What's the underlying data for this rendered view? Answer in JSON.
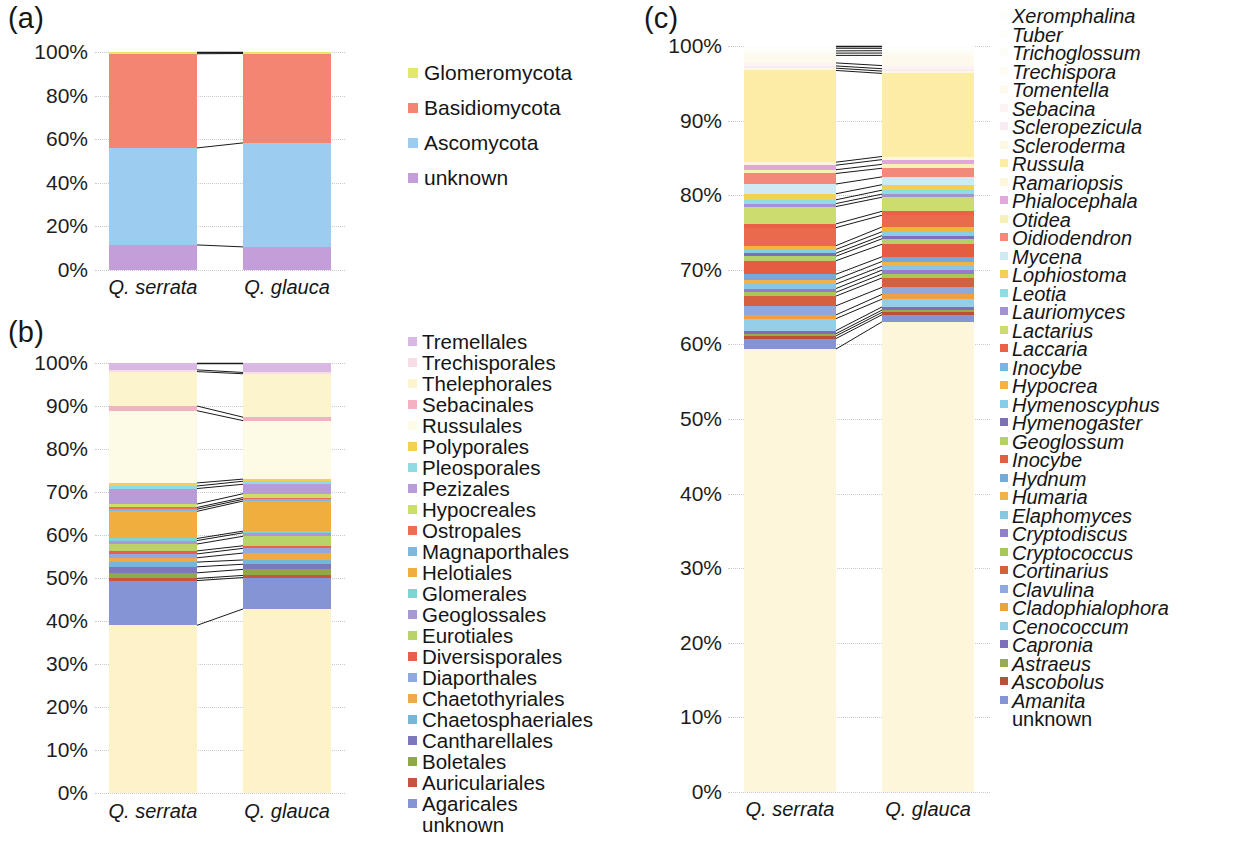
{
  "figure": {
    "panels": [
      "(a)",
      "(b)",
      "(c)"
    ],
    "x_categories": [
      "Q. serrata",
      "Q. glauca"
    ],
    "y_ticks_a": [
      "0%",
      "20%",
      "40%",
      "60%",
      "80%",
      "100%"
    ],
    "y_ticks_bc": [
      "0%",
      "10%",
      "20%",
      "30%",
      "40%",
      "50%",
      "60%",
      "70%",
      "80%",
      "90%",
      "100%"
    ],
    "unknown_label": "unknown"
  },
  "chart_data": [
    {
      "type": "bar",
      "id": "panel-a",
      "title": "(a)",
      "stacked": true,
      "normalized": true,
      "categories": [
        "Q. serrata",
        "Q. glauca"
      ],
      "xlabel": "",
      "ylabel": "",
      "ylim": [
        0,
        100
      ],
      "yticks": [
        0,
        20,
        40,
        60,
        80,
        100
      ],
      "grid": true,
      "legend_position": "right",
      "legend_order_top_to_bottom": [
        "Glomeromycota",
        "Basidiomycota",
        "Ascomycota",
        "unknown"
      ],
      "series": [
        {
          "name": "unknown",
          "color": "#c49ed8",
          "values": [
            11.5,
            10.6
          ]
        },
        {
          "name": "Ascomycota",
          "color": "#9ccdf0",
          "values": [
            44.5,
            47.7
          ]
        },
        {
          "name": "Basidiomycota",
          "color": "#f48572",
          "values": [
            43.2,
            41.0
          ]
        },
        {
          "name": "Glomeromycota",
          "color": "#e2e86a",
          "values": [
            0.8,
            0.7
          ]
        }
      ]
    },
    {
      "type": "bar",
      "id": "panel-b",
      "title": "(b)",
      "stacked": true,
      "normalized": true,
      "categories": [
        "Q. serrata",
        "Q. glauca"
      ],
      "xlabel": "",
      "ylabel": "",
      "ylim": [
        0,
        100
      ],
      "yticks": [
        0,
        10,
        20,
        30,
        40,
        50,
        60,
        70,
        80,
        90,
        100
      ],
      "grid": true,
      "legend_position": "right",
      "legend_order_top_to_bottom": [
        "Tremellales",
        "Trechisporales",
        "Thelephorales",
        "Sebacinales",
        "Russulales",
        "Polyporales",
        "Pleosporales",
        "Pezizales",
        "Hypocreales",
        "Ostropales",
        "Magnaporthales",
        "Helotiales",
        "Glomerales",
        "Geoglossales",
        "Eurotiales",
        "Diversisporales",
        "Diaporthales",
        "Chaetothyriales",
        "Chaetosphaeriales",
        "Cantharellales",
        "Boletales",
        "Auriculariales",
        "Agaricales",
        "unknown"
      ],
      "series": [
        {
          "name": "unknown",
          "color": "#fdf2c8",
          "values": [
            39.0,
            42.8
          ]
        },
        {
          "name": "Agaricales",
          "color": "#8494d4",
          "values": [
            10.4,
            7.3
          ]
        },
        {
          "name": "Auriculariales",
          "color": "#c2563f",
          "values": [
            0.5,
            0.5
          ]
        },
        {
          "name": "Boletales",
          "color": "#8fa84a",
          "values": [
            1.3,
            1.4
          ]
        },
        {
          "name": "Cantharellales",
          "color": "#7d78bc",
          "values": [
            1.4,
            1.2
          ]
        },
        {
          "name": "Chaetosphaeriales",
          "color": "#76b6d8",
          "values": [
            1.1,
            1.0
          ]
        },
        {
          "name": "Chaetothyriales",
          "color": "#eea94a",
          "values": [
            1.0,
            1.6
          ]
        },
        {
          "name": "Diaporthales",
          "color": "#8fa9dc",
          "values": [
            0.9,
            1.1
          ]
        },
        {
          "name": "Diversisporales",
          "color": "#e8604b",
          "values": [
            0.7,
            0.6
          ]
        },
        {
          "name": "Eurotiales",
          "color": "#b8d468",
          "values": [
            1.6,
            2.2
          ]
        },
        {
          "name": "Geoglossales",
          "color": "#a799d6",
          "values": [
            0.8,
            0.8
          ]
        },
        {
          "name": "Glomerales",
          "color": "#7fd4d2",
          "values": [
            0.5,
            0.4
          ]
        },
        {
          "name": "Helotiales",
          "color": "#f0ae3f",
          "values": [
            6.3,
            7.0
          ]
        },
        {
          "name": "Magnaporthales",
          "color": "#7fb7dd",
          "values": [
            0.5,
            0.4
          ]
        },
        {
          "name": "Ostropales",
          "color": "#ef6b56",
          "values": [
            0.4,
            0.4
          ]
        },
        {
          "name": "Hypocreales",
          "color": "#ccde6a",
          "values": [
            0.8,
            0.9
          ]
        },
        {
          "name": "Pezizales",
          "color": "#b79cd8",
          "values": [
            3.6,
            2.2
          ]
        },
        {
          "name": "Pleosporales",
          "color": "#8fdbe1",
          "values": [
            0.6,
            0.7
          ]
        },
        {
          "name": "Polyporales",
          "color": "#f4cf53",
          "values": [
            0.7,
            0.5
          ]
        },
        {
          "name": "Russulales",
          "color": "#fdfbe6",
          "values": [
            16.8,
            13.6
          ]
        },
        {
          "name": "Sebacinales",
          "color": "#f2b2c2",
          "values": [
            1.1,
            0.8
          ]
        },
        {
          "name": "Thelephorales",
          "color": "#fcf4cc",
          "values": [
            8.0,
            10.1
          ]
        },
        {
          "name": "Trechisporales",
          "color": "#f7dde6",
          "values": [
            0.4,
            0.3
          ]
        },
        {
          "name": "Tremellales",
          "color": "#d9b9e4",
          "values": [
            1.6,
            2.2
          ]
        }
      ]
    },
    {
      "type": "bar",
      "id": "panel-c",
      "title": "(c)",
      "stacked": true,
      "normalized": true,
      "categories": [
        "Q. serrata",
        "Q. glauca"
      ],
      "xlabel": "",
      "ylabel": "",
      "ylim": [
        0,
        100
      ],
      "yticks": [
        0,
        10,
        20,
        30,
        40,
        50,
        60,
        70,
        80,
        90,
        100
      ],
      "grid": true,
      "legend_position": "right",
      "legend_order_top_to_bottom": [
        "Xeromphalina",
        "Tuber",
        "Trichoglossum",
        "Trechispora",
        "Tomentella",
        "Sebacina",
        "Scleropezicula",
        "Scleroderma",
        "Russula",
        "Ramariopsis",
        "Phialocephala",
        "Otidea",
        "Oidiodendron",
        "Mycena",
        "Lophiostoma",
        "Leotia",
        "Lauriomyces",
        "Lactarius",
        "Laccaria",
        "Inocybe",
        "Hypocrea",
        "Hymenoscyphus",
        "Hymenogaster",
        "Geoglossum",
        "Inocybe",
        "Hydnum",
        "Humaria",
        "Elaphomyces",
        "Cryptodiscus",
        "Cryptococcus",
        "Cortinarius",
        "Clavulina",
        "Cladophialophora",
        "Cenococcum",
        "Capronia",
        "Astraeus",
        "Ascobolus",
        "Amanita",
        "unknown"
      ],
      "series": [
        {
          "name": "unknown",
          "color": "#fdf6da",
          "values": [
            58.9,
            60.0
          ]
        },
        {
          "name": "Amanita",
          "color": "#8494d4",
          "values": [
            1.4,
            0.9
          ]
        },
        {
          "name": "Ascobolus",
          "color": "#b6513b",
          "values": [
            0.35,
            0.3
          ]
        },
        {
          "name": "Astraeus",
          "color": "#95ad4d",
          "values": [
            0.3,
            0.3
          ]
        },
        {
          "name": "Capronia",
          "color": "#7d6fb8",
          "values": [
            0.4,
            0.4
          ]
        },
        {
          "name": "Cenococcum",
          "color": "#93cfe6",
          "values": [
            1.6,
            1.0
          ]
        },
        {
          "name": "Cladophialophora",
          "color": "#eda23f",
          "values": [
            0.5,
            0.6
          ]
        },
        {
          "name": "Clavulina",
          "color": "#8fa9dc",
          "values": [
            1.2,
            0.9
          ]
        },
        {
          "name": "Cortinarius",
          "color": "#d4603f",
          "values": [
            1.3,
            1.2
          ]
        },
        {
          "name": "Cryptococcus",
          "color": "#a8c75a",
          "values": [
            0.5,
            0.5
          ]
        },
        {
          "name": "Cryptodiscus",
          "color": "#8f80c8",
          "values": [
            0.5,
            0.5
          ]
        },
        {
          "name": "Elaphomyces",
          "color": "#86c8e4",
          "values": [
            0.6,
            0.5
          ]
        },
        {
          "name": "Humaria",
          "color": "#f0b34c",
          "values": [
            0.6,
            0.6
          ]
        },
        {
          "name": "Hydnum",
          "color": "#75a9d6",
          "values": [
            0.7,
            0.6
          ]
        },
        {
          "name": "Inocybe",
          "color": "#e45c42",
          "values": [
            1.8,
            1.6
          ]
        },
        {
          "name": "Geoglossum",
          "color": "#b5d06a",
          "values": [
            0.6,
            0.7
          ]
        },
        {
          "name": "Hymenogaster",
          "color": "#7d6fb8",
          "values": [
            0.4,
            0.4
          ]
        },
        {
          "name": "Hymenoscyphus",
          "color": "#86cde8",
          "values": [
            0.5,
            0.5
          ]
        },
        {
          "name": "Hypocrea",
          "color": "#f0b63c",
          "values": [
            0.5,
            0.6
          ]
        },
        {
          "name": "Inocybe",
          "color": "#ea6a4e",
          "values": [
            2.4,
            1.5
          ]
        },
        {
          "name": "Laccaria",
          "color": "#ea6145",
          "values": [
            0.5,
            0.5
          ]
        },
        {
          "name": "Lactarius",
          "color": "#ccdc6f",
          "values": [
            2.3,
            1.8
          ]
        },
        {
          "name": "Lauriomyces",
          "color": "#a391d4",
          "values": [
            0.4,
            0.4
          ]
        },
        {
          "name": "Leotia",
          "color": "#8fdde4",
          "values": [
            0.5,
            0.5
          ]
        },
        {
          "name": "Lophiostoma",
          "color": "#f4cf53",
          "values": [
            0.8,
            0.7
          ]
        },
        {
          "name": "Mycena",
          "color": "#cfeaf2",
          "values": [
            1.3,
            1.0
          ]
        },
        {
          "name": "Oidiodendron",
          "color": "#f2897a",
          "values": [
            1.4,
            1.1
          ]
        },
        {
          "name": "Otidea",
          "color": "#f7f0b8",
          "values": [
            0.5,
            0.5
          ]
        },
        {
          "name": "Phialocephala",
          "color": "#e0a8d8",
          "values": [
            0.6,
            0.6
          ]
        },
        {
          "name": "Ramariopsis",
          "color": "#fdf6da",
          "values": [
            0.4,
            0.4
          ]
        },
        {
          "name": "Russula",
          "color": "#fbeca6",
          "values": [
            12.2,
            10.6
          ]
        },
        {
          "name": "Scleroderma",
          "color": "#fdf8e2",
          "values": [
            0.3,
            0.3
          ]
        },
        {
          "name": "Scleropezicula",
          "color": "#f8ecf2",
          "values": [
            0.3,
            0.3
          ]
        },
        {
          "name": "Sebacina",
          "color": "#fdf2f4",
          "values": [
            0.4,
            0.4
          ]
        },
        {
          "name": "Tomentella",
          "color": "#fdf9ec",
          "values": [
            1.0,
            1.3
          ]
        },
        {
          "name": "Trechispora",
          "color": "#fdfbf2",
          "values": [
            0.3,
            0.3
          ]
        },
        {
          "name": "Trichoglossum",
          "color": "#fdfdf8",
          "values": [
            0.3,
            0.3
          ]
        },
        {
          "name": "Tuber",
          "color": "#fdfdfa",
          "values": [
            0.35,
            0.3
          ]
        },
        {
          "name": "Xeromphalina",
          "color": "#fdfdfc",
          "values": [
            0.3,
            0.3
          ]
        }
      ]
    }
  ],
  "legends": {
    "phyla": [
      {
        "label": "Glomeromycota",
        "color": "#e2e86a"
      },
      {
        "label": "Basidiomycota",
        "color": "#f48572"
      },
      {
        "label": "Ascomycota",
        "color": "#9ccdf0"
      },
      {
        "label": "unknown",
        "color": "#c49ed8"
      }
    ],
    "orders": [
      {
        "label": "Tremellales",
        "color": "#d9b9e4"
      },
      {
        "label": "Trechisporales",
        "color": "#f7dde6"
      },
      {
        "label": "Thelephorales",
        "color": "#fcf4cc"
      },
      {
        "label": "Sebacinales",
        "color": "#f2b2c2"
      },
      {
        "label": "Russulales",
        "color": "#fdfbe6"
      },
      {
        "label": "Polyporales",
        "color": "#f4cf53"
      },
      {
        "label": "Pleosporales",
        "color": "#8fdbe1"
      },
      {
        "label": "Pezizales",
        "color": "#b79cd8"
      },
      {
        "label": "Hypocreales",
        "color": "#ccde6a"
      },
      {
        "label": "Ostropales",
        "color": "#ef6b56"
      },
      {
        "label": "Magnaporthales",
        "color": "#7fb7dd"
      },
      {
        "label": "Helotiales",
        "color": "#f0ae3f"
      },
      {
        "label": "Glomerales",
        "color": "#7fd4d2"
      },
      {
        "label": "Geoglossales",
        "color": "#a799d6"
      },
      {
        "label": "Eurotiales",
        "color": "#b8d468"
      },
      {
        "label": "Diversisporales",
        "color": "#e8604b"
      },
      {
        "label": "Diaporthales",
        "color": "#8fa9dc"
      },
      {
        "label": "Chaetothyriales",
        "color": "#eea94a"
      },
      {
        "label": "Chaetosphaeriales",
        "color": "#76b6d8"
      },
      {
        "label": "Cantharellales",
        "color": "#7d78bc"
      },
      {
        "label": "Boletales",
        "color": "#8fa84a"
      },
      {
        "label": "Auriculariales",
        "color": "#c2563f"
      },
      {
        "label": "Agaricales",
        "color": "#8494d4"
      },
      {
        "label": "unknown",
        "color": "transparent"
      }
    ],
    "genera": [
      {
        "label": "Xeromphalina",
        "color": "#fdfdfc"
      },
      {
        "label": "Tuber",
        "color": "#fdfdfa"
      },
      {
        "label": "Trichoglossum",
        "color": "#fdfdf8"
      },
      {
        "label": "Trechispora",
        "color": "#fdfbf2"
      },
      {
        "label": "Tomentella",
        "color": "#fdf9ec"
      },
      {
        "label": "Sebacina",
        "color": "#fdf2f4"
      },
      {
        "label": "Scleropezicula",
        "color": "#f8ecf2"
      },
      {
        "label": "Scleroderma",
        "color": "#fdf8e2"
      },
      {
        "label": "Russula",
        "color": "#fbeca6"
      },
      {
        "label": "Ramariopsis",
        "color": "#fdf6da"
      },
      {
        "label": "Phialocephala",
        "color": "#e0a8d8"
      },
      {
        "label": "Otidea",
        "color": "#f7f0b8"
      },
      {
        "label": "Oidiodendron",
        "color": "#f2897a"
      },
      {
        "label": "Mycena",
        "color": "#cfeaf2"
      },
      {
        "label": "Lophiostoma",
        "color": "#f4cf53"
      },
      {
        "label": "Leotia",
        "color": "#8fdde4"
      },
      {
        "label": "Lauriomyces",
        "color": "#a391d4"
      },
      {
        "label": "Lactarius",
        "color": "#ccdc6f"
      },
      {
        "label": "Laccaria",
        "color": "#ea6145"
      },
      {
        "label": "Inocybe",
        "color": "#6fb8e8"
      },
      {
        "label": "Hypocrea",
        "color": "#f0b63c"
      },
      {
        "label": "Hymenoscyphus",
        "color": "#86cde8"
      },
      {
        "label": "Hymenogaster",
        "color": "#7d6fb8"
      },
      {
        "label": "Geoglossum",
        "color": "#b5d06a"
      },
      {
        "label": "Inocybe",
        "color": "#e45c42"
      },
      {
        "label": "Hydnum",
        "color": "#75a9d6"
      },
      {
        "label": "Humaria",
        "color": "#f0b34c"
      },
      {
        "label": "Elaphomyces",
        "color": "#86c8e4"
      },
      {
        "label": "Cryptodiscus",
        "color": "#8f80c8"
      },
      {
        "label": "Cryptococcus",
        "color": "#a8c75a"
      },
      {
        "label": "Cortinarius",
        "color": "#d4603f"
      },
      {
        "label": "Clavulina",
        "color": "#8fa9dc"
      },
      {
        "label": "Cladophialophora",
        "color": "#eda23f"
      },
      {
        "label": "Cenococcum",
        "color": "#93cfe6"
      },
      {
        "label": "Capronia",
        "color": "#7d6fb8"
      },
      {
        "label": "Astraeus",
        "color": "#95ad4d"
      },
      {
        "label": "Ascobolus",
        "color": "#b6513b"
      },
      {
        "label": "Amanita",
        "color": "#8494d4"
      },
      {
        "label": "unknown",
        "color": "transparent"
      }
    ]
  }
}
